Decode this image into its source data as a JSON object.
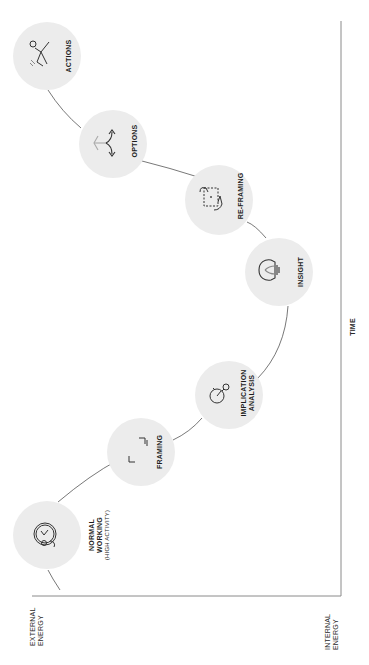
{
  "diagram": {
    "type": "energy-curve-process",
    "orientation": "rotated-90-ccw",
    "colors": {
      "node_fill": "#ececec",
      "curve_stroke": "#555555",
      "axis_stroke": "#8a8a8a",
      "text": "#1d1d1d"
    },
    "axes": {
      "time_label": "TIME",
      "start_label_line1": "EXTERNAL",
      "start_label_line2": "ENERGY",
      "end_label_line1": "INTERNAL",
      "end_label_line2": "ENERGY"
    },
    "nodes": [
      {
        "id": "normal-working",
        "label_line1": "NORMAL",
        "label_line2": "WORKING",
        "sublabel": "(HIGH ACTIVITY)",
        "icon": "clock-person-icon"
      },
      {
        "id": "framing",
        "label_line1": "FRAMING",
        "icon": "frame-corners-icon"
      },
      {
        "id": "implication-analysis",
        "label_line1": "IMPLICATION",
        "label_line2": "ANALYSIS",
        "icon": "stopwatch-magnifier-icon"
      },
      {
        "id": "insight",
        "label_line1": "INSIGHT",
        "icon": "lightbulb-icon"
      },
      {
        "id": "re-framing",
        "label_line1": "RE-FRAMING",
        "icon": "hands-reframe-icon"
      },
      {
        "id": "options",
        "label_line1": "OPTIONS",
        "icon": "branching-arrows-icon"
      },
      {
        "id": "actions",
        "label_line1": "ACTIONS",
        "icon": "running-person-icon"
      }
    ]
  }
}
